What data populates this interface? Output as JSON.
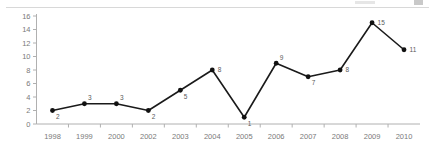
{
  "chart_data": {
    "type": "line",
    "title": "",
    "xlabel": "",
    "ylabel": "",
    "categories": [
      "1998",
      "1999",
      "2000",
      "2002",
      "2003",
      "2004",
      "2005",
      "2006",
      "2007",
      "2008",
      "2009",
      "2010"
    ],
    "values": [
      2,
      3,
      3,
      2,
      5,
      8,
      1,
      9,
      7,
      8,
      15,
      11
    ],
    "point_labels": [
      "2",
      "3",
      "3",
      "2",
      "5",
      "8",
      "1",
      "9",
      "7",
      "8",
      "15",
      "11"
    ],
    "label_positions": [
      "below-right",
      "above-right",
      "above-right",
      "below-right",
      "below-right",
      "right",
      "below-right",
      "above-right",
      "below-right",
      "right",
      "right",
      "right"
    ],
    "ylim": [
      0,
      16
    ],
    "yticks": [
      0,
      2,
      4,
      6,
      8,
      10,
      12,
      14,
      16
    ],
    "ytick_labels": [
      "0",
      "2",
      "4",
      "6",
      "8",
      "10",
      "12",
      "14",
      "16"
    ],
    "grid": false,
    "legend": "none",
    "series_color": "#1a1a1a",
    "axis_color": "#b0b0b0",
    "tick_label_color": "#7a7a7a",
    "point_label_color": "#5a5a5a",
    "background": "#ffffff",
    "missing_category": "2001"
  }
}
